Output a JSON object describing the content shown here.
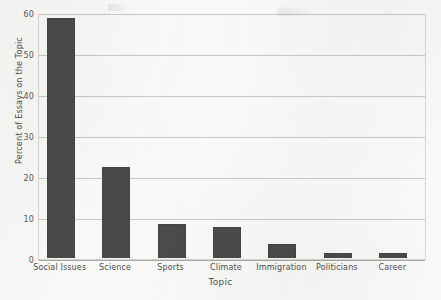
{
  "chart_data": {
    "type": "bar",
    "title": "",
    "xlabel": "Topic",
    "ylabel": "Percent of Essays on the Topic",
    "categories": [
      "Social Issues",
      "Science",
      "Sports",
      "Climate",
      "Immigration",
      "Politicians",
      "Career"
    ],
    "values": [
      58.5,
      22.3,
      8.4,
      7.6,
      3.4,
      1.3,
      1.3
    ],
    "ylim": [
      0,
      60
    ],
    "yticks": [
      0,
      10,
      20,
      30,
      40,
      50,
      60
    ],
    "ytick_labels": [
      "0",
      "10",
      "20",
      "30",
      "40",
      "50",
      "60"
    ],
    "grid": true,
    "legend": false,
    "bar_color": "#4b4b4b",
    "background_color": "#fbfbf9",
    "gridline_color": "#c9c9c5"
  },
  "axes": {
    "y_title": "Percent of Essays on the Topic",
    "x_title": "Topic",
    "ticks_y": [
      {
        "label": "60",
        "value": 60
      },
      {
        "label": "50",
        "value": 50
      },
      {
        "label": "40",
        "value": 40
      },
      {
        "label": "30",
        "value": 30
      },
      {
        "label": "20",
        "value": 20
      },
      {
        "label": "10",
        "value": 10
      },
      {
        "label": "0",
        "value": 0
      }
    ]
  },
  "bars": [
    {
      "label": "Social Issues",
      "value": 58.5
    },
    {
      "label": "Science",
      "value": 22.3
    },
    {
      "label": "Sports",
      "value": 8.4
    },
    {
      "label": "Climate",
      "value": 7.6
    },
    {
      "label": "Immigration",
      "value": 3.4
    },
    {
      "label": "Politicians",
      "value": 1.3
    },
    {
      "label": "Career",
      "value": 1.3
    }
  ]
}
